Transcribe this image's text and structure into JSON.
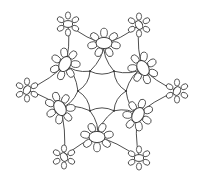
{
  "image": {
    "description": "Line-art snowflake lace pattern with twelve daisy-like flowers",
    "background": "#ffffff",
    "stroke_color": "#3a3a3a",
    "symmetry": 6,
    "center": [
      102,
      91
    ],
    "inner_flowers": [
      {
        "cx": 104,
        "cy": 43,
        "rot": 0
      },
      {
        "cx": 143,
        "cy": 68,
        "rot": 60
      },
      {
        "cx": 138,
        "cy": 115,
        "rot": 120
      },
      {
        "cx": 97,
        "cy": 137,
        "rot": 180
      },
      {
        "cx": 60,
        "cy": 108,
        "rot": 240
      },
      {
        "cx": 65,
        "cy": 64,
        "rot": 300
      }
    ],
    "outer_flowers": [
      {
        "cx": 68,
        "cy": 24
      },
      {
        "cx": 139,
        "cy": 25
      },
      {
        "cx": 177,
        "cy": 91
      },
      {
        "cx": 139,
        "cy": 158
      },
      {
        "cx": 64,
        "cy": 157
      },
      {
        "cx": 27,
        "cy": 90
      }
    ]
  }
}
